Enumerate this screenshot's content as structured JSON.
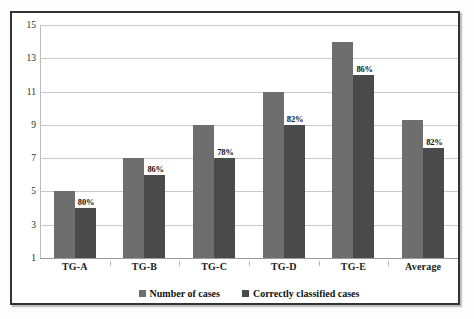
{
  "chart_data": {
    "type": "bar",
    "title": "",
    "subtitle": "",
    "xlabel": "",
    "ylabel": "",
    "categories": [
      "TG-A",
      "TG-B",
      "TG-C",
      "TG-D",
      "TG-E",
      "Average"
    ],
    "series": [
      {
        "name": "Number of  cases",
        "color": "#6e6e6e",
        "values": [
          5,
          7,
          9,
          11,
          14,
          9.3
        ]
      },
      {
        "name": "Correctly classified cases",
        "color": "#4a4a4a",
        "values": [
          4,
          6,
          7,
          9,
          12,
          7.6
        ]
      }
    ],
    "point_labels": [
      "80%",
      "86%",
      "78%",
      "82%",
      "86%",
      "82%"
    ],
    "ylim": [
      1,
      15
    ],
    "yticks": [
      1,
      3,
      5,
      7,
      9,
      11,
      13,
      15
    ],
    "ytick_labels": [
      "1",
      "3",
      "5",
      "7",
      "9",
      "11",
      "13",
      "15"
    ],
    "grid": true,
    "legend_position": "bottom"
  },
  "legend": {
    "items": [
      {
        "label": "Number of  cases",
        "swatch": "series-1-swatch"
      },
      {
        "label": "Correctly classified cases",
        "swatch": "series-2-swatch"
      }
    ]
  },
  "colors": {
    "series_1": "#6e6e6e",
    "series_2": "#4a4a4a",
    "grid": "#c9c9c9",
    "frame": "#333333",
    "text": "#111111"
  }
}
